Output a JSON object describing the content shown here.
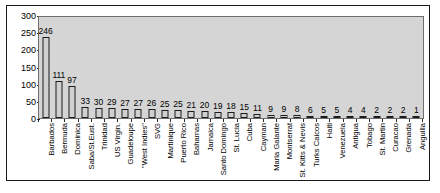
{
  "chart_data": {
    "type": "bar",
    "title": "",
    "subtitle": "",
    "xlabel": "",
    "ylabel": "",
    "ylim": [
      0,
      300
    ],
    "yticks": [
      0,
      50,
      100,
      150,
      200,
      250,
      300
    ],
    "grid": false,
    "legend": false,
    "value_labels": true,
    "categories": [
      "Barbados",
      "Bermuda",
      "Dominica",
      "Saba/St.Eust.",
      "Trinidad",
      "US Virgin.",
      "Guadeloupe",
      "\"West Indies\"",
      "SVG",
      "Martinique",
      "Puerto Rico",
      "Bahamas",
      "Jamaica",
      "Santo Domingo",
      "St. Lucia",
      "Cuba",
      "Cayman",
      "Maria Galante",
      "Montserrat",
      "St. Kitts & Nevis",
      "Turks Caicos",
      "Haiti",
      "Venezuela",
      "Antigua",
      "Tobago",
      "St. Martin",
      "Curacao",
      "Grenada",
      "Anguilla"
    ],
    "values": [
      246,
      111,
      97,
      33,
      30,
      29,
      27,
      27,
      26,
      25,
      25,
      21,
      20,
      19,
      18,
      15,
      11,
      9,
      9,
      8,
      6,
      5,
      5,
      4,
      4,
      2,
      2,
      2,
      1
    ],
    "colors": {
      "bar_fill": "#d0d0d0",
      "bar_stroke": "#1c1c1c",
      "plot_background": "#d5d5d5",
      "plot_border": "#6e6e6e",
      "figure_border": "#1a1a1a",
      "text": "#000000"
    }
  }
}
